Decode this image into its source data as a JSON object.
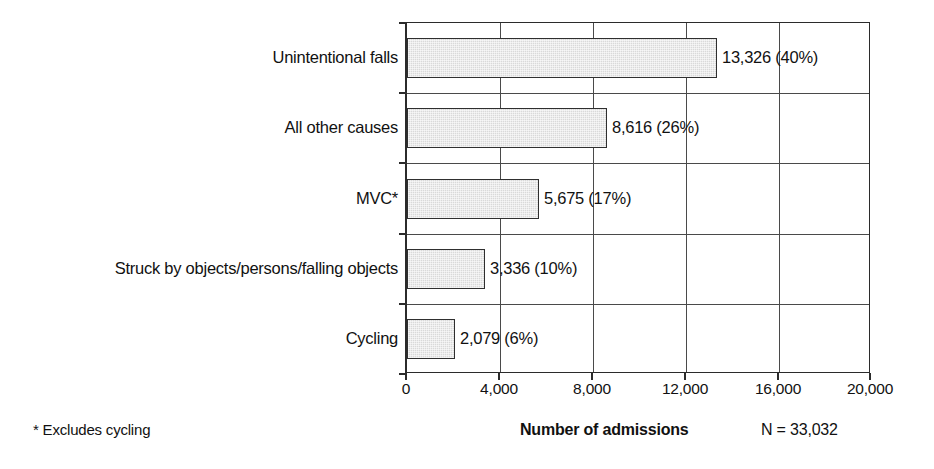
{
  "chart_data": {
    "type": "bar",
    "orientation": "horizontal",
    "title": "",
    "xlabel": "Number of admissions",
    "ylabel": "",
    "xlim": [
      0,
      20000
    ],
    "grid": true,
    "legend": null,
    "categories": [
      "Unintentional falls",
      "All other causes",
      "MVC*",
      "Struck by objects/persons/falling objects",
      "Cycling"
    ],
    "values": [
      13326,
      8616,
      5675,
      3336,
      2079
    ],
    "percentages": [
      40,
      26,
      17,
      10,
      6
    ],
    "data_labels": [
      "13,326 (40%)",
      "8,616 (26%)",
      "5,675 (17%)",
      "3,336 (10%)",
      "2,079 (6%)"
    ],
    "xticks": [
      0,
      4000,
      8000,
      12000,
      16000,
      20000
    ],
    "xtick_labels": [
      "0",
      "4,000",
      "8,000",
      "12,000",
      "16,000",
      "20,000"
    ],
    "annotations": {
      "footnote": "* Excludes cycling",
      "total": "N = 33,032"
    },
    "colors": {
      "bar_fill": "#d9d9d9",
      "bar_stroke": "#2f2f2f",
      "axis": "#2b2b2b",
      "grid": "#4a4a4a",
      "text": "#111111",
      "background": "#ffffff"
    }
  }
}
